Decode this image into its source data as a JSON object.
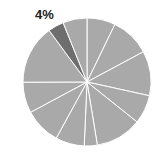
{
  "chart_data": {
    "type": "pie",
    "title": "",
    "start_angle_deg": 0,
    "direction": "clockwise",
    "values": [
      7.2,
      10.0,
      11.3,
      7.3,
      11.7,
      3.3,
      7.3,
      9.2,
      7.8,
      15.0,
      4.0,
      6.1
    ],
    "highlight_index": 10,
    "labels_shown": [
      {
        "index": 10,
        "text": "4%"
      }
    ],
    "legend": []
  },
  "style": {
    "slice_color": "#a9a9a9",
    "highlight_color": "#6e6e6e",
    "separator_color": "#ffffff",
    "label_color": "#222222"
  },
  "geometry": {
    "cx": 87,
    "cy": 82,
    "r": 64
  }
}
